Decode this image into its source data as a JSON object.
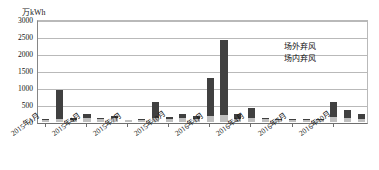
{
  "chart_data": {
    "type": "bar",
    "subtype": "stacked-column",
    "title": "",
    "xlabel": "",
    "ylabel": "万kWh",
    "unit_label": "万kWh",
    "ylim": [
      0,
      3000
    ],
    "ytick_values": [
      0,
      500,
      1000,
      1500,
      2000,
      2500,
      3000
    ],
    "ytick_labels": [
      "0",
      "500",
      "1000",
      "1500",
      "2000",
      "2500",
      "3000"
    ],
    "grid": true,
    "grid_axis": "y",
    "legend_position": "inside-top-right",
    "categories": [
      "2015年1月",
      "2015年2月",
      "2015年3月",
      "2015年4月",
      "2015年5月",
      "2015年6月",
      "2015年7月",
      "2015年8月",
      "2015年9月",
      "2015年10月",
      "2015年11月",
      "2015年12月",
      "2016年1月",
      "2016年2月",
      "2016年3月",
      "2016年4月",
      "2016年5月",
      "2016年6月",
      "2016年7月",
      "2016年8月",
      "2016年9月",
      "2016年10月",
      "2016年11月",
      "2016年12月"
    ],
    "xtick_labels_shown": [
      "2015年1月",
      "2015年4月",
      "2015年7月",
      "2015年10月",
      "2016年1月",
      "2016年4月",
      "2016年7月",
      "2016年10月"
    ],
    "xtick_label_indices": [
      0,
      3,
      6,
      9,
      12,
      15,
      18,
      21
    ],
    "series": [
      {
        "name": "场内弃风",
        "color": "#bfbfbf",
        "stack_order": "bottom",
        "values": [
          60,
          90,
          70,
          130,
          80,
          120,
          50,
          60,
          110,
          100,
          120,
          80,
          180,
          220,
          100,
          130,
          80,
          60,
          60,
          70,
          70,
          150,
          130,
          90
        ]
      },
      {
        "name": "场外弃风",
        "color": "#404040",
        "stack_order": "top",
        "values": [
          20,
          860,
          40,
          120,
          30,
          60,
          20,
          30,
          490,
          40,
          130,
          110,
          1120,
          2180,
          150,
          280,
          40,
          30,
          30,
          30,
          20,
          430,
          230,
          160
        ]
      }
    ],
    "totals": [
      80,
      950,
      110,
      250,
      110,
      180,
      70,
      90,
      600,
      140,
      250,
      190,
      1300,
      2400,
      250,
      410,
      120,
      90,
      90,
      100,
      90,
      580,
      360,
      250
    ]
  },
  "legend": {
    "items": [
      {
        "label": "场外弃风",
        "color": "#404040"
      },
      {
        "label": "场内弃风",
        "color": "#bfbfbf"
      }
    ]
  },
  "colors": {
    "series_outer": "#404040",
    "series_inner": "#bfbfbf",
    "gridline": "#b9b9b9",
    "axis": "#6e6e6e",
    "text": "#111111",
    "background": "#ffffff"
  }
}
